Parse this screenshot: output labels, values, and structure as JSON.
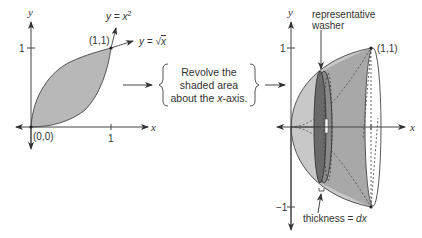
{
  "left_graph": {
    "y_axis_label": "y",
    "x_axis_label": "x",
    "y_tick_label": "1",
    "x_tick_label": "1",
    "origin_label": "(0,0)",
    "intersection_label": "(1,1)",
    "curve_upper_label": "y = x²",
    "curve_upper_eq_prefix": "y = x",
    "curve_upper_exp": "2",
    "curve_lower_label": "y = √x",
    "curve_lower_eq_prefix": "y = ",
    "curve_lower_radical": "√",
    "curve_lower_radicand": "x",
    "shaded_fill": "#b8b8b8"
  },
  "instruction": {
    "line1": "Revolve the",
    "line2": "shaded area",
    "line3_prefix": "about the ",
    "line3_var": "x",
    "line3_suffix": "-axis."
  },
  "right_graph": {
    "y_axis_label": "y",
    "x_axis_label": "x",
    "y_tick_top_label": "1",
    "y_tick_bottom_label": "−1",
    "x_tick_label": "1",
    "point_label": "(1,1)",
    "washer_label_line1": "representative",
    "washer_label_line2": "washer",
    "thickness_label_prefix": "thickness = ",
    "thickness_label_var": "dx",
    "solid_fill": "#c8c8c8",
    "solid_dark_fill": "#9a9a9a",
    "washer_fill": "#6a6a6a"
  }
}
